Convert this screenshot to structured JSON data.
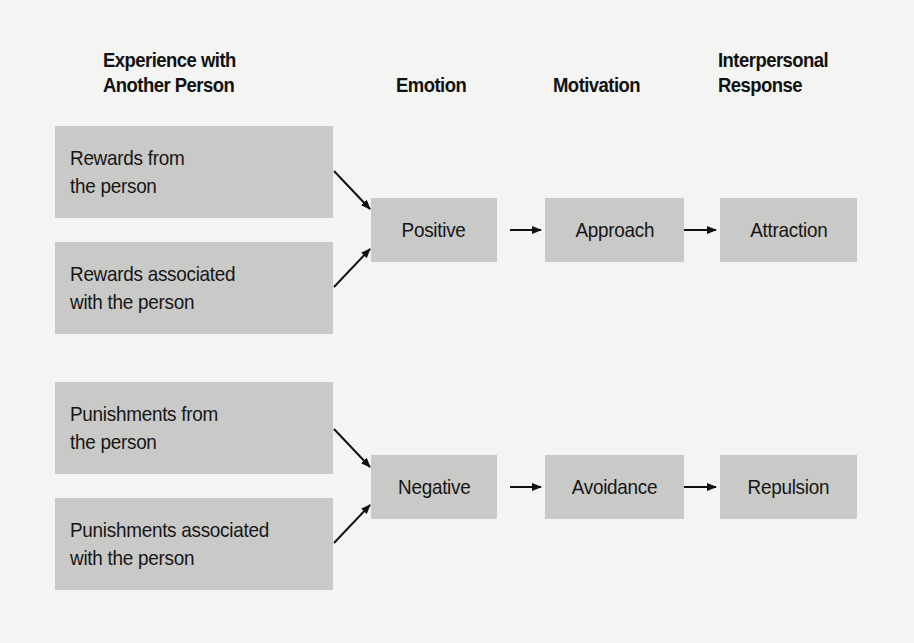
{
  "headings": {
    "experience_line1": "Experience with",
    "experience_line2": "Another Person",
    "emotion": "Emotion",
    "motivation": "Motivation",
    "response_line1": "Interpersonal",
    "response_line2": "Response"
  },
  "sources": [
    {
      "line1": "Rewards from",
      "line2": "the person"
    },
    {
      "line1": "Rewards associated",
      "line2": "with the person"
    },
    {
      "line1": "Punishments from",
      "line2": "the person"
    },
    {
      "line1": "Punishments associated",
      "line2": "with the person"
    }
  ],
  "paths": [
    {
      "emotion": "Positive",
      "motivation": "Approach",
      "response": "Attraction"
    },
    {
      "emotion": "Negative",
      "motivation": "Avoidance",
      "response": "Repulsion"
    }
  ],
  "colors": {
    "background": "#f4f4f3",
    "box_fill": "#c9c9c8",
    "text": "#111111",
    "arrow": "#111111"
  }
}
